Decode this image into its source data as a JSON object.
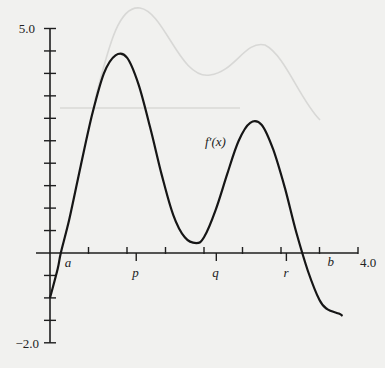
{
  "chart_data": {
    "type": "line",
    "title": "",
    "series": [
      {
        "name": "f'(x)",
        "x": [
          0.0,
          0.1,
          0.14,
          0.25,
          0.4,
          0.55,
          0.7,
          0.85,
          1.0,
          1.15,
          1.3,
          1.45,
          1.6,
          1.75,
          1.9,
          2.0,
          2.15,
          2.3,
          2.45,
          2.6,
          2.75,
          2.9,
          3.05,
          3.2,
          3.35,
          3.5,
          3.6,
          3.75,
          3.8
        ],
        "values": [
          -1.0,
          -0.35,
          0.0,
          0.75,
          1.95,
          3.1,
          4.0,
          4.4,
          4.35,
          3.75,
          2.8,
          1.75,
          0.85,
          0.35,
          0.22,
          0.35,
          0.95,
          1.75,
          2.5,
          2.9,
          2.85,
          2.3,
          1.45,
          0.45,
          -0.4,
          -1.05,
          -1.25,
          -1.35,
          -1.4
        ]
      }
    ],
    "curve_label": "f′(x)",
    "xlabel": "",
    "ylabel": "",
    "xlim": [
      0,
      4.0
    ],
    "ylim": [
      -2.0,
      5.0
    ],
    "y_tick_step": 0.5,
    "x_tick_step": 0.5,
    "y_tick_labels": [
      "5.0",
      "−2.0"
    ],
    "x_tick_labels": [
      "4.0"
    ],
    "x_points": [
      {
        "label": "a",
        "x": 0.14
      },
      {
        "label": "p",
        "x": 1.12
      },
      {
        "label": "q",
        "x": 2.16
      },
      {
        "label": "r",
        "x": 3.07
      },
      {
        "label": "b",
        "x": 3.76
      }
    ],
    "grid": false,
    "legend": "none"
  },
  "labels": {
    "curve": "f′(x)",
    "y_max": "5.0",
    "y_min": "−2.0",
    "x_max": "4.0",
    "a": "a",
    "p": "p",
    "q": "q",
    "r": "r",
    "b": "b"
  }
}
